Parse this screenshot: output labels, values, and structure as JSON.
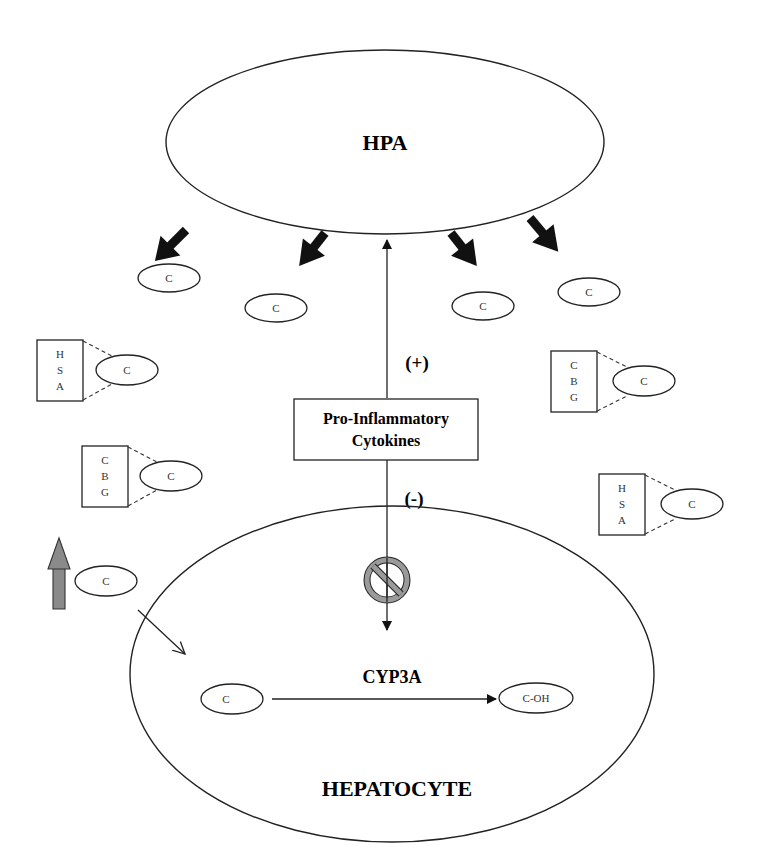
{
  "diagram": {
    "hpa": {
      "label": "HPA"
    },
    "hepatocyte": {
      "label": "HEPATOCYTE"
    },
    "cytokines": {
      "line1": "Pro-Inflammatory",
      "line2": "Cytokines"
    },
    "signs": {
      "plus": "(+)",
      "minus": "(-)"
    },
    "enzyme": {
      "label": "CYP3A"
    },
    "molecules": {
      "cortisol": "C",
      "hydroxylated": "C-OH"
    },
    "binding_proteins": {
      "hsa": [
        "H",
        "S",
        "A"
      ],
      "cbg": [
        "C",
        "B",
        "G"
      ]
    },
    "free_cortisol": [
      {
        "label": "C",
        "cx": 169,
        "cy": 278
      },
      {
        "label": "C",
        "cx": 276,
        "cy": 308
      },
      {
        "label": "C",
        "cx": 483,
        "cy": 306
      },
      {
        "label": "C",
        "cx": 589,
        "cy": 292
      }
    ],
    "colors": {
      "stroke": "#222222",
      "thick_arrow": "#111111",
      "up_arrow_fill": "#8a8a8a",
      "inhibit_fill": "#9a9a9a"
    }
  }
}
